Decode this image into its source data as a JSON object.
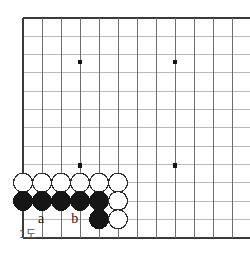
{
  "figure": {
    "kind": "go-board-diagram",
    "caption": "1도",
    "board": {
      "cols": 12,
      "rows": 12,
      "x0": 23,
      "y0": 18,
      "dx": 19,
      "dy": 18.3,
      "edge_color": "#3a3a3a",
      "line_color": "#6e6e6e",
      "line_color_faint": "#b9b9b9",
      "background": "#ffffff",
      "shows_left_edge": true,
      "shows_bottom_edge": true,
      "shows_top_edge": true,
      "shows_right_edge": false
    },
    "star_points": [
      {
        "name": "star-point-upper-left",
        "col": 3,
        "row": 2.4
      },
      {
        "name": "star-point-upper-right",
        "col": 8,
        "row": 2.4
      },
      {
        "name": "star-point-lower-left",
        "col": 3,
        "row": 8.05
      },
      {
        "name": "star-point-lower-right",
        "col": 8,
        "row": 8.05
      }
    ],
    "stone_radius": 9.5,
    "stones": [
      {
        "id": "white-1",
        "color": "white",
        "col": 0,
        "row": 9.0
      },
      {
        "id": "white-2",
        "color": "white",
        "col": 1,
        "row": 9.0
      },
      {
        "id": "white-3",
        "color": "white",
        "col": 2,
        "row": 9.0
      },
      {
        "id": "white-4",
        "color": "white",
        "col": 3,
        "row": 9.0
      },
      {
        "id": "white-5",
        "color": "white",
        "col": 4,
        "row": 9.0
      },
      {
        "id": "white-6",
        "color": "white",
        "col": 5,
        "row": 9.0
      },
      {
        "id": "black-1",
        "color": "black",
        "col": 0,
        "row": 10.0
      },
      {
        "id": "black-2",
        "color": "black",
        "col": 1,
        "row": 10.0
      },
      {
        "id": "black-3",
        "color": "black",
        "col": 2,
        "row": 10.0
      },
      {
        "id": "black-4",
        "color": "black",
        "col": 3,
        "row": 10.0
      },
      {
        "id": "black-5",
        "color": "black",
        "col": 4,
        "row": 10.0
      },
      {
        "id": "white-7",
        "color": "white",
        "col": 5,
        "row": 10.0
      },
      {
        "id": "black-6",
        "color": "black",
        "col": 4,
        "row": 11.0
      },
      {
        "id": "white-8",
        "color": "white",
        "col": 5,
        "row": 11.0
      }
    ],
    "point_labels": [
      {
        "id": "label-a",
        "text": "a",
        "col": 1,
        "row": 11.0
      },
      {
        "id": "label-b",
        "text": "b",
        "col": 2.75,
        "row": 11.0
      }
    ]
  }
}
